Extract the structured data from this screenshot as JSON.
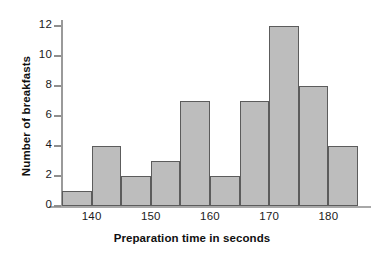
{
  "chart_data": {
    "type": "bar",
    "title": "",
    "subtitle": "",
    "xlabel": "Preparation time in seconds",
    "ylabel": "Number of breakfasts",
    "categories": [
      "135-140",
      "140-145",
      "145-150",
      "150-155",
      "155-160",
      "160-165",
      "165-170",
      "170-175",
      "175-180",
      "180-185"
    ],
    "bin_edges": [
      135,
      140,
      145,
      150,
      155,
      160,
      165,
      170,
      175,
      180,
      185
    ],
    "bin_width": 5,
    "values": [
      1,
      4,
      2,
      3,
      7,
      2,
      7,
      12,
      8,
      4
    ],
    "xlim": [
      135,
      185
    ],
    "ylim": [
      0,
      12
    ],
    "y_ticks": [
      0,
      2,
      4,
      6,
      8,
      10,
      12
    ],
    "x_ticks": [
      140,
      150,
      160,
      170,
      180
    ],
    "grid": false,
    "legend": null,
    "legend_position": "none",
    "annotations": [],
    "colors": {
      "bar_fill": "#bdbdbd",
      "bar_stroke": "#5c5c5c",
      "axis": "#a0a0a0",
      "text": "#101010",
      "background": "#ffffff"
    }
  },
  "axes": {
    "y_tick_labels": [
      "0",
      "2",
      "4",
      "6",
      "8",
      "10",
      "12"
    ],
    "x_tick_labels": [
      "140",
      "150",
      "160",
      "170",
      "180"
    ],
    "x_title": "Preparation time in seconds",
    "y_title": "Number of breakfasts"
  }
}
